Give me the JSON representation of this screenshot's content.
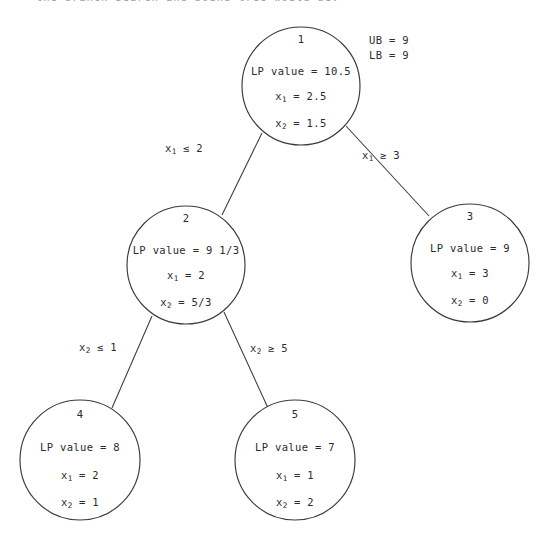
{
  "figure": {
    "title_fragment": "the branch search and bound tree would be:",
    "type": "branch-and-bound-tree"
  },
  "bounds": {
    "ub_label": "UB = 9",
    "lb_label": "LB = 9"
  },
  "nodes": [
    {
      "id": "1",
      "lp_line": "LP value = 10.5",
      "x1_label": "x",
      "x1_sub": "1",
      "x1_value": "= 2.5",
      "x2_label": "x",
      "x2_sub": "2",
      "x2_value": "= 1.5"
    },
    {
      "id": "2",
      "lp_line": "LP value = 9 1/3",
      "x1_label": "x",
      "x1_sub": "1",
      "x1_value": "= 2",
      "x2_label": "x",
      "x2_sub": "2",
      "x2_value": "= 5/3"
    },
    {
      "id": "3",
      "lp_line": "LP value = 9",
      "x1_label": "x",
      "x1_sub": "1",
      "x1_value": "= 3",
      "x2_label": "x",
      "x2_sub": "2",
      "x2_value": "= 0"
    },
    {
      "id": "4",
      "lp_line": "LP value = 8",
      "x1_label": "x",
      "x1_sub": "1",
      "x1_value": "= 2",
      "x2_label": "x",
      "x2_sub": "2",
      "x2_value": "= 1"
    },
    {
      "id": "5",
      "lp_line": "LP value = 7",
      "x1_label": "x",
      "x1_sub": "1",
      "x1_value": "= 1",
      "x2_label": "x",
      "x2_sub": "2",
      "x2_value": "= 2"
    }
  ],
  "edges": [
    {
      "name": "edge-1-2",
      "var": "x",
      "sub": "1",
      "relation": "≤ 2"
    },
    {
      "name": "edge-1-3",
      "var": "x",
      "sub": "1",
      "relation": "≥ 3"
    },
    {
      "name": "edge-2-4",
      "var": "x",
      "sub": "2",
      "relation": "≤ 1"
    },
    {
      "name": "edge-2-5",
      "var": "x",
      "sub": "2",
      "relation": "≥ 5"
    }
  ],
  "colors": {
    "ink": "#2b2b2b",
    "stroke": "#3a3a3a",
    "background": "#ffffff"
  }
}
